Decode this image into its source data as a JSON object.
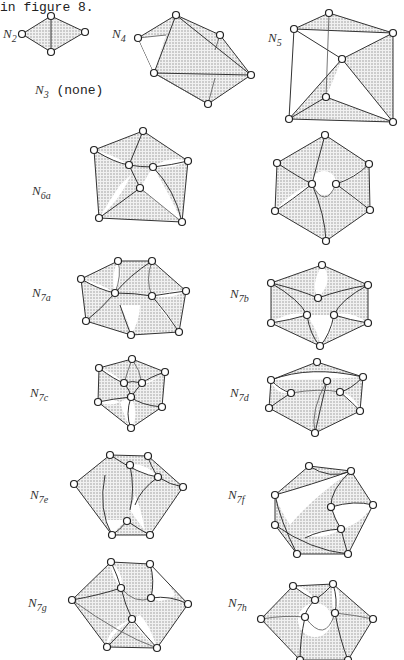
{
  "intro_text": "in figure 8.",
  "figures": [
    {
      "id": "N2",
      "label_main": "N",
      "label_sub": "2"
    },
    {
      "id": "N3",
      "label_main": "N",
      "label_sub": "3",
      "note": "(none)"
    },
    {
      "id": "N4",
      "label_main": "N",
      "label_sub": "4"
    },
    {
      "id": "N5",
      "label_main": "N",
      "label_sub": "5"
    },
    {
      "id": "N6a",
      "label_main": "N",
      "label_sub": "6a"
    },
    {
      "id": "N6b",
      "label_main": "N",
      "label_sub": "6b"
    },
    {
      "id": "N7a",
      "label_main": "N",
      "label_sub": "7a"
    },
    {
      "id": "N7b",
      "label_main": "N",
      "label_sub": "7b"
    },
    {
      "id": "N7c",
      "label_main": "N",
      "label_sub": "7c"
    },
    {
      "id": "N7d",
      "label_main": "N",
      "label_sub": "7d"
    },
    {
      "id": "N7e",
      "label_main": "N",
      "label_sub": "7e"
    },
    {
      "id": "N7f",
      "label_main": "N",
      "label_sub": "7f"
    },
    {
      "id": "N7g",
      "label_main": "N",
      "label_sub": "7g"
    },
    {
      "id": "N7h",
      "label_main": "N",
      "label_sub": "7h"
    }
  ],
  "colors": {
    "ink": "#222222",
    "shade": "#8a8a8a",
    "paper": "#ffffff"
  }
}
